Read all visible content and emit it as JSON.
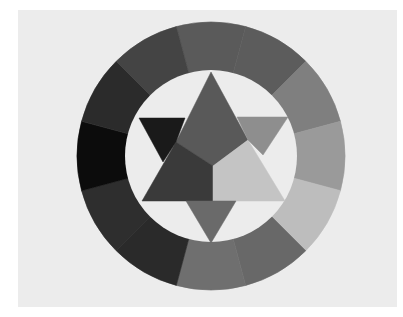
{
  "image": {
    "subject": "Twelve-part color wheel with inscribed star (grayscale print)",
    "background_color": "#ffffff",
    "card_color": "#ececec",
    "inner_disc_color": "#ececec"
  },
  "wheel": {
    "center": [
      211,
      156
    ],
    "outer_radius": 134,
    "inner_radius": 86,
    "segments": [
      {
        "name": "segment-top-left-1",
        "start_deg": -105,
        "end_deg": -75,
        "color": "#5a5a5a"
      },
      {
        "name": "segment-top-1",
        "start_deg": -75,
        "end_deg": -45,
        "color": "#5c5c5c"
      },
      {
        "name": "segment-top-right-1",
        "start_deg": -45,
        "end_deg": -15,
        "color": "#7f7f7f"
      },
      {
        "name": "segment-right-1",
        "start_deg": -15,
        "end_deg": 15,
        "color": "#9a9a9a"
      },
      {
        "name": "segment-right-2",
        "start_deg": 15,
        "end_deg": 45,
        "color": "#bdbdbd"
      },
      {
        "name": "segment-bottom-right-1",
        "start_deg": 45,
        "end_deg": 75,
        "color": "#686868"
      },
      {
        "name": "segment-bottom-1",
        "start_deg": 75,
        "end_deg": 105,
        "color": "#6f6f6f"
      },
      {
        "name": "segment-bottom-left-1",
        "start_deg": 105,
        "end_deg": 135,
        "color": "#2a2a2a"
      },
      {
        "name": "segment-left-lower",
        "start_deg": 135,
        "end_deg": 165,
        "color": "#2e2e2e"
      },
      {
        "name": "segment-left",
        "start_deg": 165,
        "end_deg": 195,
        "color": "#0c0c0c"
      },
      {
        "name": "segment-left-upper",
        "start_deg": 195,
        "end_deg": 225,
        "color": "#2b2b2b"
      },
      {
        "name": "segment-top-left-2",
        "start_deg": 225,
        "end_deg": 255,
        "color": "#444444"
      }
    ]
  },
  "star": {
    "up_triangle": {
      "points": "211,72 142,201 285,201"
    },
    "down_triangle": {
      "points": "139,118 288,117 211,243"
    },
    "regions": [
      {
        "name": "top-triangle-region",
        "points": "211,72 248,140 213,166 176,142",
        "color": "#595959"
      },
      {
        "name": "left-lower-region",
        "points": "176,142 213,166 213,201 142,201",
        "color": "#3a3a3a"
      },
      {
        "name": "right-lower-region",
        "points": "213,166 248,140 285,201 213,201",
        "color": "#c4c4c4"
      },
      {
        "name": "top-left-point",
        "points": "139,118 185,118 176,142 163,162",
        "color": "#1a1a1a"
      },
      {
        "name": "top-right-point",
        "points": "237,117 288,117 263,155 248,140",
        "color": "#8e8e8e"
      },
      {
        "name": "bottom-point",
        "points": "186,201 236,201 211,243",
        "color": "#6a6a6a"
      }
    ]
  }
}
